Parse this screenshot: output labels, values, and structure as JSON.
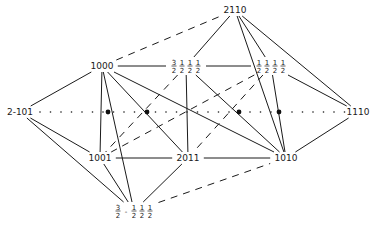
{
  "diagram": {
    "type": "graph",
    "colors": {
      "ink": "#1a1a1a",
      "background": "#ffffff"
    },
    "nodes": [
      {
        "id": "n2110",
        "label": "2110",
        "x": 235,
        "y": 10,
        "kind": "text"
      },
      {
        "id": "n1000",
        "label": "1000",
        "x": 102,
        "y": 66,
        "kind": "text"
      },
      {
        "id": "nC",
        "label": "3/2 1/2 1/2 1/2",
        "x": 186,
        "y": 66,
        "kind": "fraction",
        "parts": [
          "3/2",
          "1/2",
          "1/2",
          "1/2"
        ]
      },
      {
        "id": "nD",
        "label": "1/2 1/2 1/2 1/2",
        "x": 271,
        "y": 66,
        "kind": "fraction",
        "parts": [
          "1/2",
          "1/2",
          "1/2",
          "1/2"
        ]
      },
      {
        "id": "n2m101",
        "label": "2-101",
        "x": 20,
        "y": 112,
        "kind": "text"
      },
      {
        "id": "n1110",
        "label": "1110",
        "x": 358,
        "y": 112,
        "kind": "text"
      },
      {
        "id": "n1001",
        "label": "1001",
        "x": 100,
        "y": 158,
        "kind": "text"
      },
      {
        "id": "n2011",
        "label": "2011",
        "x": 188,
        "y": 158,
        "kind": "text"
      },
      {
        "id": "n1010",
        "label": "1010",
        "x": 286,
        "y": 158,
        "kind": "text"
      },
      {
        "id": "nJ",
        "label": "3/2 -1/2 1/2 1/2",
        "x": 134,
        "y": 211,
        "kind": "fraction",
        "parts": [
          "3/2",
          "-",
          "1/2",
          "1/2",
          "1/2"
        ]
      }
    ],
    "axis": {
      "style": "dotted",
      "y": 112,
      "x_start": 40,
      "x_end": 345,
      "filled_points_x": [
        108,
        147,
        239,
        279
      ]
    },
    "edges_solid": [
      [
        "n2m101",
        "n1000"
      ],
      [
        "n2m101",
        "n1001"
      ],
      [
        "n2m101",
        "nJ"
      ],
      [
        "n1000",
        "nC"
      ],
      [
        "n1000",
        "n1001"
      ],
      [
        "n1000",
        "nJ"
      ],
      [
        "n1000",
        "n2011"
      ],
      [
        "n1000",
        "n1010"
      ],
      [
        "nC",
        "nD"
      ],
      [
        "nC",
        "n2011"
      ],
      [
        "nC",
        "n1010"
      ],
      [
        "n2110",
        "nC"
      ],
      [
        "n2110",
        "nD"
      ],
      [
        "n2110",
        "n1010"
      ],
      [
        "n2110",
        "n1110"
      ],
      [
        "nD",
        "n1010"
      ],
      [
        "nD",
        "n1110"
      ],
      [
        "n1110",
        "n1010"
      ],
      [
        "n1001",
        "n2011"
      ],
      [
        "n2011",
        "n1010"
      ],
      [
        "n1001",
        "nJ"
      ],
      [
        "n2011",
        "nJ"
      ]
    ],
    "edges_dashed": [
      [
        "n1000",
        "n2110"
      ],
      [
        "nJ",
        "n1010"
      ],
      [
        "nC",
        "n1001"
      ],
      [
        "nD",
        "n1001"
      ],
      [
        "nD",
        "n2011"
      ]
    ]
  }
}
